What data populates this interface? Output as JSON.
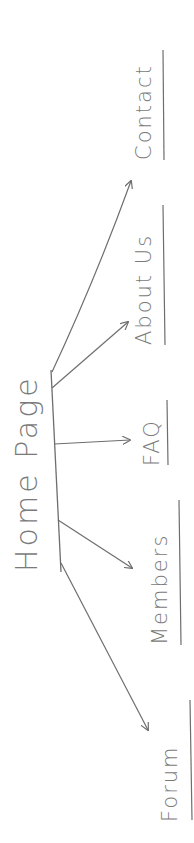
{
  "diagram": {
    "type": "sitemap",
    "orientation": "rotated-90-ccw",
    "style": "hand-drawn pencil",
    "ink_color": "#7a7a7a",
    "root": {
      "label": "Home Page"
    },
    "children": [
      {
        "label": "Forum"
      },
      {
        "label": "Members"
      },
      {
        "label": "FAQ"
      },
      {
        "label": "About Us"
      },
      {
        "label": "Contact"
      }
    ]
  }
}
